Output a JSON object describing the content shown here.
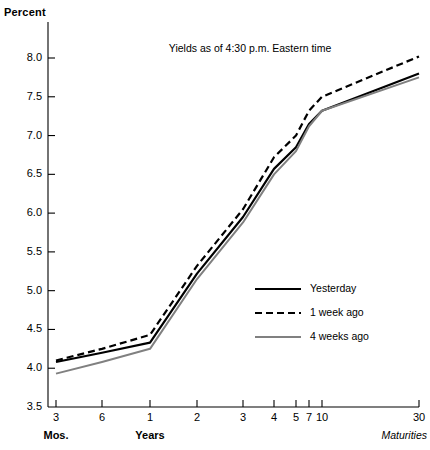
{
  "chart_data": {
    "type": "line",
    "title": "Yields as of 4:30 p.m. Eastern time",
    "ylabel": "Percent",
    "xlabel": "Maturities",
    "x_group_labels": [
      "Mos.",
      "Years"
    ],
    "grid": false,
    "legend_position": "inside-right",
    "ylim": [
      3.5,
      8.0
    ],
    "yticks": [
      "3.5",
      "4.0",
      "4.5",
      "5.0",
      "5.5",
      "6.0",
      "6.5",
      "7.0",
      "7.5",
      "8.0"
    ],
    "ytick_values": [
      3.5,
      4.0,
      4.5,
      5.0,
      5.5,
      6.0,
      6.5,
      7.0,
      7.5,
      8.0
    ],
    "categories": [
      "3",
      "6",
      "1",
      "2",
      "3",
      "4",
      "5",
      "7",
      "10",
      "30"
    ],
    "x_positions": [
      56,
      102,
      150,
      197,
      243,
      274,
      296,
      309,
      322,
      419
    ],
    "series": [
      {
        "name": "Yesterday",
        "style": "solid",
        "color": "#000000",
        "width": 2.2,
        "values": [
          4.08,
          4.2,
          4.33,
          5.22,
          5.95,
          6.57,
          6.85,
          7.15,
          7.32,
          7.8
        ]
      },
      {
        "name": "1 week ago",
        "style": "dashed",
        "color": "#000000",
        "width": 2.2,
        "values": [
          4.1,
          4.25,
          4.43,
          5.32,
          6.05,
          6.72,
          7.0,
          7.32,
          7.5,
          8.02
        ]
      },
      {
        "name": "4 weeks ago",
        "style": "solid",
        "color": "#808080",
        "width": 2.0,
        "values": [
          3.93,
          4.08,
          4.25,
          5.15,
          5.88,
          6.5,
          6.8,
          7.12,
          7.32,
          7.75
        ]
      }
    ]
  },
  "legend": {
    "entries": [
      {
        "label": "Yesterday"
      },
      {
        "label": "1 week ago"
      },
      {
        "label": "4 weeks ago"
      }
    ]
  }
}
